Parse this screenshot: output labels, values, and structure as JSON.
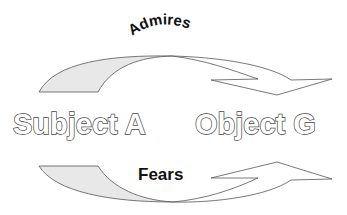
{
  "diagram": {
    "type": "relationship",
    "nodes": [
      {
        "id": "subject",
        "label": "Subject A"
      },
      {
        "id": "object",
        "label": "Object G"
      }
    ],
    "relations": [
      {
        "label": "Admires",
        "from": "Subject A",
        "to": "Object G",
        "position": "top",
        "direction": "curved-down-right"
      },
      {
        "label": "Fears",
        "from": "Subject A",
        "to": "Object G",
        "position": "bottom",
        "direction": "curved-up-right"
      }
    ],
    "colors": {
      "arrow_tail_fill": "#e8e8e8",
      "arrow_head_fill": "#ffffff",
      "arrow_stroke": "#555555",
      "label_outline": "#444444",
      "relation_text": "#111111"
    }
  },
  "labels": {
    "subject": "Subject A",
    "object": "Object G",
    "top_relation": "Admires",
    "bottom_relation": "Fears"
  }
}
